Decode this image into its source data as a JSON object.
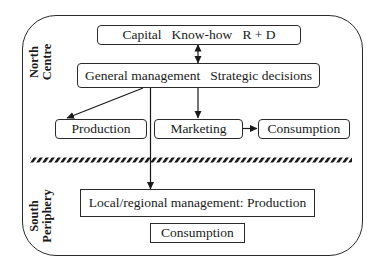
{
  "diagram": {
    "regions": {
      "north": {
        "line1": "North",
        "line2": "Centre"
      },
      "south": {
        "line1": "South",
        "line2": "Periphery"
      }
    },
    "nodes": {
      "capital": "Capital   Know-how   R + D",
      "general_management": "General management   Strategic decisions",
      "production": "Production",
      "marketing": "Marketing",
      "consumption_north": "Consumption",
      "local_management": "Local/regional management: Production",
      "consumption_south": "Consumption"
    },
    "edges": [
      {
        "from": "capital",
        "to": "general_management",
        "type": "bidirectional"
      },
      {
        "from": "general_management",
        "to": "production",
        "type": "arrow"
      },
      {
        "from": "general_management",
        "to": "marketing",
        "type": "arrow"
      },
      {
        "from": "marketing",
        "to": "consumption_north",
        "type": "arrow"
      },
      {
        "from": "general_management",
        "to": "local_management",
        "type": "arrow"
      }
    ],
    "divider": "hatched line separating North/Centre from South/Periphery",
    "colors": {
      "stroke": "#2a2a2a",
      "background": "#ffffff"
    }
  }
}
